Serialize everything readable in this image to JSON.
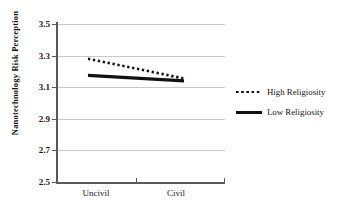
{
  "chart_data": {
    "type": "line",
    "title": "",
    "xlabel": "",
    "ylabel": "Nanotechnology Risk Perception",
    "categories": [
      "Uncivil",
      "Civil"
    ],
    "x": [
      0,
      1
    ],
    "xlim": [
      -0.5,
      1.5
    ],
    "ylim": [
      2.5,
      3.5
    ],
    "yticks": [
      "3.5",
      "3.3",
      "3.1",
      "2.9",
      "2.7",
      "2.5"
    ],
    "ytick_values": [
      3.5,
      3.3,
      3.1,
      2.9,
      2.7,
      2.5
    ],
    "grid": "horizontal",
    "legend_position": "right",
    "series": [
      {
        "name": "High Religiosity",
        "style": "dotted",
        "color": "#111111",
        "values": [
          3.28,
          3.155
        ]
      },
      {
        "name": "Low Religiosity",
        "style": "solid",
        "color": "#111111",
        "values": [
          3.175,
          3.14
        ]
      }
    ]
  },
  "axis": {
    "y_label": "Nanotechnology Risk Perception",
    "y_ticks": [
      {
        "label": "3.5",
        "value": 3.5
      },
      {
        "label": "3.3",
        "value": 3.3
      },
      {
        "label": "3.1",
        "value": 3.1
      },
      {
        "label": "2.9",
        "value": 2.9
      },
      {
        "label": "2.7",
        "value": 2.7
      },
      {
        "label": "2.5",
        "value": 2.5
      }
    ],
    "x_ticks": [
      {
        "label": "Uncivil"
      },
      {
        "label": "Civil"
      }
    ]
  },
  "legend": {
    "items": [
      {
        "label": "High Religiosity",
        "key": "dotted-line-key"
      },
      {
        "label": "Low Religiosity",
        "key": "solid-line-key"
      }
    ]
  }
}
